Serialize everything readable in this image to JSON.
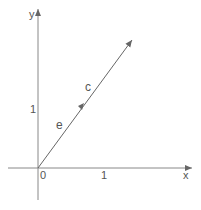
{
  "diagram": {
    "type": "vector-plot",
    "axes": {
      "x_label": "x",
      "y_label": "y",
      "origin_label": "0",
      "x_tick_label": "1",
      "y_tick_label": "1"
    },
    "vectors": [
      {
        "name": "e",
        "label": "e",
        "from": [
          0,
          0
        ],
        "to": "unit vector along c"
      },
      {
        "name": "c",
        "label": "c",
        "from": [
          0,
          0
        ],
        "to": "longer vector, same direction as e"
      }
    ],
    "colors": {
      "line": "#666666",
      "text": "#555555",
      "background": "#ffffff"
    }
  }
}
